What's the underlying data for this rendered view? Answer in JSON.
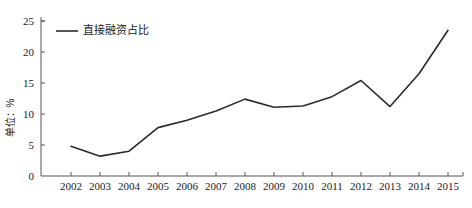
{
  "chart_data": {
    "type": "line",
    "title": "",
    "subtitle": "",
    "xlabel": "",
    "ylabel": "单位：%",
    "xlim": [
      2002,
      2015
    ],
    "ylim": [
      0,
      25
    ],
    "grid": false,
    "legend_position": "top-left",
    "categories": [
      2002,
      2003,
      2004,
      2005,
      2006,
      2007,
      2008,
      2009,
      2010,
      2011,
      2012,
      2013,
      2014,
      2015
    ],
    "x_tick_labels": [
      "2002",
      "2003",
      "2004",
      "2005",
      "2006",
      "2007",
      "2008",
      "2009",
      "2010",
      "2011",
      "2012",
      "2013",
      "2014",
      "2015"
    ],
    "y_ticks": [
      0,
      5,
      10,
      15,
      20,
      25
    ],
    "y_tick_labels": [
      "0",
      "5",
      "10",
      "15",
      "20",
      "25"
    ],
    "series": [
      {
        "name": "直接融资占比",
        "color": "#2b2b2b",
        "values": [
          4.8,
          3.2,
          4.0,
          7.8,
          9.0,
          10.5,
          12.4,
          11.1,
          11.3,
          12.8,
          15.4,
          11.2,
          16.5,
          23.5
        ]
      }
    ],
    "legend": [
      {
        "label": "直接融资占比",
        "color": "#2b2b2b"
      }
    ],
    "axis_color": "#555555",
    "line_color": "#2b2b2b"
  }
}
